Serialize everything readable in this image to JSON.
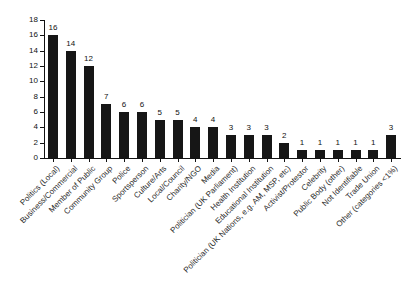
{
  "chart_data": {
    "type": "bar",
    "title": "",
    "subtitle": "",
    "xlabel": "",
    "ylabel": "",
    "ylim": [
      0,
      18
    ],
    "ytick_step": 2,
    "yticks": [
      0,
      2,
      4,
      6,
      8,
      10,
      12,
      14,
      16,
      18
    ],
    "grid": false,
    "legend": false,
    "bar_color": "#161616",
    "axis_color": "#111111",
    "show_value_labels": true,
    "xtick_label_rotation": -45,
    "categories": [
      "Politics (Local)",
      "Business/Commercial",
      "Member of Public",
      "Community Group",
      "Police",
      "Sportsperson",
      "Culture/Arts",
      "Local/Council",
      "Charity/NGO",
      "Media",
      "Politician (UK Parliament)",
      "Health Institution",
      "Educational Institution",
      "Politician (UK Nations, e.g. AM, MSP, etc)",
      "Activist/Protestor",
      "Celebrity",
      "Public Body (other)",
      "Not Identifiable",
      "Trade Union",
      "Other (categories <1%)"
    ],
    "values": [
      16,
      14,
      12,
      7,
      6,
      6,
      5,
      5,
      4,
      4,
      3,
      3,
      3,
      2,
      1,
      1,
      1,
      1,
      1,
      3
    ]
  }
}
